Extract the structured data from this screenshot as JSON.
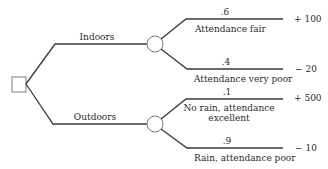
{
  "diagram": {
    "type": "decision-tree",
    "decision_node": {
      "shape": "square"
    },
    "alternatives": [
      {
        "label": "Indoors",
        "chance_node": {
          "shape": "circle"
        },
        "outcomes": [
          {
            "probability": ".6",
            "label_lines": [
              "Attendance fair"
            ],
            "payoff": "+ 100"
          },
          {
            "probability": ".4",
            "label_lines": [
              "Attendance very poor"
            ],
            "payoff": "− 20"
          }
        ]
      },
      {
        "label": "Outdoors",
        "chance_node": {
          "shape": "circle"
        },
        "outcomes": [
          {
            "probability": ".1",
            "label_lines": [
              "No rain, attendance",
              "excellent"
            ],
            "payoff": "+ 500"
          },
          {
            "probability": ".9",
            "label_lines": [
              "Rain, attendance poor"
            ],
            "payoff": "− 10"
          }
        ]
      }
    ],
    "colors": {
      "line": "#3a3a3a",
      "node_outline": "#7a7a7a",
      "text": "#2a2a2a",
      "background": "#ffffff"
    }
  }
}
